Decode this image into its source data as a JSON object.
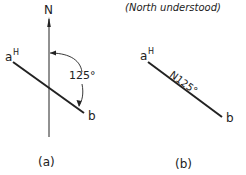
{
  "figure_a": {
    "north_label": "N",
    "angle_label": "125°",
    "point_a": "a",
    "point_a_sup": "H",
    "point_b": "b",
    "caption": "(a)"
  },
  "figure_b": {
    "note": "(North understood)",
    "bearing_label": "N125°",
    "point_a": "a",
    "point_a_sup": "H",
    "point_b": "b",
    "caption": "(b)"
  },
  "colors": {
    "ink": "#222222",
    "background": "#ffffff"
  }
}
